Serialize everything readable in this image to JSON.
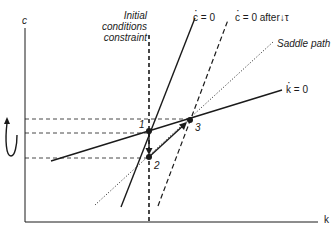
{
  "axes": {
    "y_label": "c",
    "x_label": "k"
  },
  "labels": {
    "initial_conditions": [
      "Initial",
      "conditions",
      "constraint"
    ],
    "c_dot_zero": "c = 0",
    "c_dot_zero_after": "c = 0 after↓τ",
    "saddle_path": "Saddle path",
    "k_dot_zero": "k = 0"
  },
  "points": [
    {
      "id": "1",
      "label": "1",
      "x": 149,
      "y": 131
    },
    {
      "id": "2",
      "label": "2",
      "x": 149,
      "y": 157
    },
    {
      "id": "3",
      "label": "3",
      "x": 190,
      "y": 120
    }
  ],
  "colors": {
    "line": "#1a1a1a",
    "background": "#ffffff"
  }
}
